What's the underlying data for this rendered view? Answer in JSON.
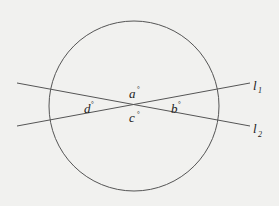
{
  "diagram": {
    "type": "geometry",
    "colors": {
      "stroke": "#555555",
      "text": "#222222",
      "background": "#f1f1ef"
    },
    "circle": {
      "cx": 134,
      "cy": 106,
      "r": 85
    },
    "lines": [
      {
        "id": "l1",
        "label": "l",
        "subscript": "1",
        "x1": 17,
        "y1": 126,
        "x2": 250,
        "y2": 83
      },
      {
        "id": "l2",
        "label": "l",
        "subscript": "2",
        "x1": 17,
        "y1": 83,
        "x2": 250,
        "y2": 126
      }
    ],
    "angles": [
      {
        "id": "a",
        "label": "a",
        "unit": "°"
      },
      {
        "id": "b",
        "label": "b",
        "unit": "°"
      },
      {
        "id": "c",
        "label": "c",
        "unit": "°"
      },
      {
        "id": "d",
        "label": "d",
        "unit": "°"
      }
    ]
  }
}
